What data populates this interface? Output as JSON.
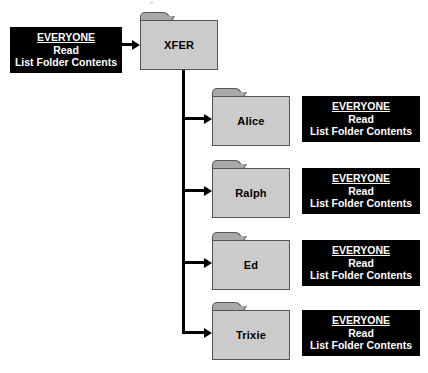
{
  "diagram": {
    "type": "folder-permission-tree",
    "colors": {
      "folder_body": "#cbcbcb",
      "folder_tab": "#a8a8a8",
      "folder_border": "#555555",
      "callout_background": "#000000",
      "callout_text": "#ffffff",
      "connector": "#000000",
      "canvas_background": "#ffffff"
    }
  },
  "permission_lines": {
    "principal": "EVERYONE",
    "read": "Read",
    "list": "List Folder Contents"
  },
  "root": {
    "folder_label": "XFER",
    "permissions": {
      "principal": "EVERYONE",
      "read": "Read",
      "list": "List Folder Contents"
    }
  },
  "children": [
    {
      "folder_label": "Alice",
      "permissions": {
        "principal": "EVERYONE",
        "read": "Read",
        "list": "List Folder Contents"
      }
    },
    {
      "folder_label": "Ralph",
      "permissions": {
        "principal": "EVERYONE",
        "read": "Read",
        "list": "List Folder Contents"
      }
    },
    {
      "folder_label": "Ed",
      "permissions": {
        "principal": "EVERYONE",
        "read": "Read",
        "list": "List Folder Contents"
      }
    },
    {
      "folder_label": "Trixie",
      "permissions": {
        "principal": "EVERYONE",
        "read": "Read",
        "list": "List Folder Contents"
      }
    }
  ]
}
